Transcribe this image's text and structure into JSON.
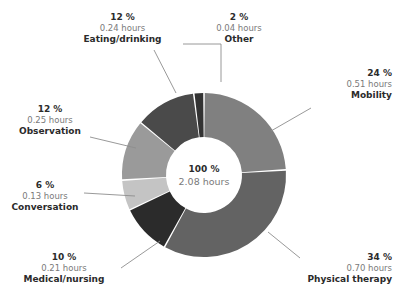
{
  "chart_data": {
    "type": "pie",
    "variant": "donut",
    "title": "",
    "subtitle": "",
    "xlabel": "",
    "ylabel": "",
    "legend_position": "none",
    "grid": false,
    "value_unit": "hours",
    "total": {
      "percent_label": "100 %",
      "value_label": "2.08 hours",
      "percent": 100,
      "value": 2.08
    },
    "categories": [
      "Mobility",
      "Physical therapy",
      "Medical/nursing",
      "Conversation",
      "Observation",
      "Eating/drinking",
      "Other"
    ],
    "values": [
      0.51,
      0.7,
      0.21,
      0.13,
      0.25,
      0.24,
      0.04
    ],
    "percents": [
      24,
      34,
      10,
      6,
      12,
      12,
      2
    ],
    "slices": [
      {
        "name": "Mobility",
        "percent": 24,
        "percent_label": "24 %",
        "value": 0.51,
        "value_label": "0.51 hours",
        "color": "#808080"
      },
      {
        "name": "Physical therapy",
        "percent": 34,
        "percent_label": "34 %",
        "value": 0.7,
        "value_label": "0.70 hours",
        "color": "#636363"
      },
      {
        "name": "Medical/nursing",
        "percent": 10,
        "percent_label": "10 %",
        "value": 0.21,
        "value_label": "0.21 hours",
        "color": "#2b2b2b"
      },
      {
        "name": "Conversation",
        "percent": 6,
        "percent_label": "6 %",
        "value": 0.13,
        "value_label": "0.13 hours",
        "color": "#c4c4c4"
      },
      {
        "name": "Observation",
        "percent": 12,
        "percent_label": "12 %",
        "value": 0.25,
        "value_label": "0.25 hours",
        "color": "#9a9a9a"
      },
      {
        "name": "Eating/drinking",
        "percent": 12,
        "percent_label": "12 %",
        "value": 0.24,
        "value_label": "0.24 hours",
        "color": "#4a4a4a"
      },
      {
        "name": "Other",
        "percent": 2,
        "percent_label": "2 %",
        "value": 0.04,
        "value_label": "0.04 hours",
        "color": "#333333"
      }
    ],
    "colors": {
      "background": "#ffffff",
      "label_text": "#2b2b2b",
      "sub_text": "#7a7a7a",
      "leader_line": "#8d8d8d"
    }
  }
}
